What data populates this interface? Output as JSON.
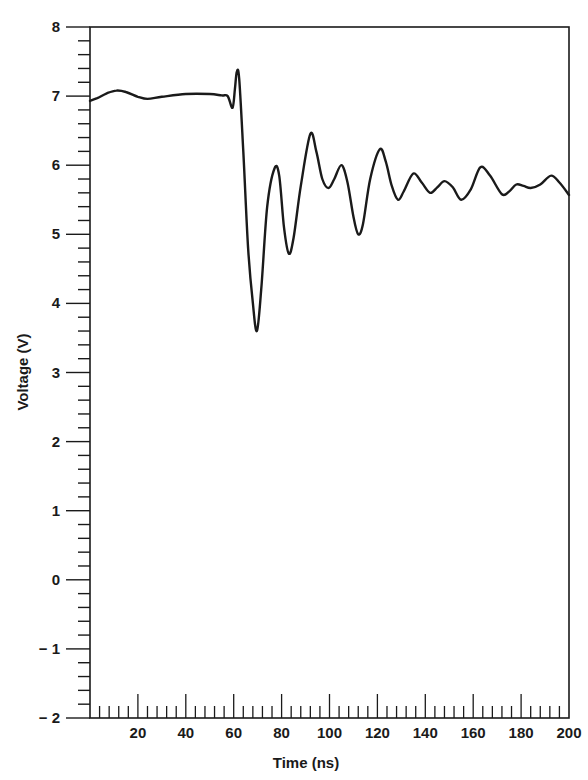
{
  "chart_data": {
    "type": "line",
    "title": "",
    "xlabel": "Time (ns)",
    "ylabel": "Voltage (V)",
    "xlim": [
      0,
      200
    ],
    "ylim": [
      -2,
      8
    ],
    "grid": false,
    "legend": null,
    "x_ticks": [
      20,
      40,
      60,
      80,
      100,
      120,
      140,
      160,
      180,
      200
    ],
    "x_tick_labels": [
      "20",
      "40",
      "60",
      "80",
      "100",
      "120",
      "140",
      "160",
      "180",
      "200"
    ],
    "x_minor_step": 4,
    "y_ticks": [
      -2,
      -1,
      0,
      1,
      2,
      3,
      4,
      5,
      6,
      7,
      8
    ],
    "y_tick_labels": [
      "− 2",
      "− 1",
      "0",
      "1",
      "2",
      "3",
      "4",
      "5",
      "6",
      "7",
      "8"
    ],
    "y_minor_step": 0.2,
    "line_color": "#1a1a1a",
    "series": [
      {
        "name": "Voltage",
        "x": [
          0,
          3,
          7,
          11,
          15,
          20,
          24,
          30,
          40,
          50,
          55,
          57.5,
          59.5,
          60.5,
          61.3,
          62.3,
          64,
          66,
          68,
          69.7,
          71.5,
          74,
          77,
          79,
          81,
          83,
          85,
          88,
          92,
          94.5,
          97,
          99.6,
          102,
          105,
          107.5,
          110,
          112,
          114,
          117,
          121,
          123.5,
          126,
          128.6,
          131,
          135,
          138.5,
          142,
          145,
          148,
          151.5,
          155,
          159,
          163,
          167,
          172,
          175,
          178,
          181,
          184,
          188,
          192.5,
          196,
          200
        ],
        "y": [
          6.93,
          6.97,
          7.04,
          7.08,
          7.06,
          6.99,
          6.96,
          6.99,
          7.03,
          7.03,
          7.01,
          7.0,
          6.83,
          7.1,
          7.35,
          7.25,
          6.2,
          4.8,
          4.0,
          3.6,
          4.2,
          5.4,
          5.95,
          5.85,
          5.1,
          4.72,
          4.95,
          5.7,
          6.45,
          6.2,
          5.8,
          5.67,
          5.8,
          6.0,
          5.75,
          5.25,
          5.0,
          5.15,
          5.8,
          6.23,
          6.05,
          5.7,
          5.5,
          5.62,
          5.88,
          5.75,
          5.6,
          5.68,
          5.77,
          5.68,
          5.5,
          5.65,
          5.97,
          5.85,
          5.58,
          5.62,
          5.72,
          5.7,
          5.67,
          5.72,
          5.85,
          5.75,
          5.57
        ]
      }
    ]
  }
}
